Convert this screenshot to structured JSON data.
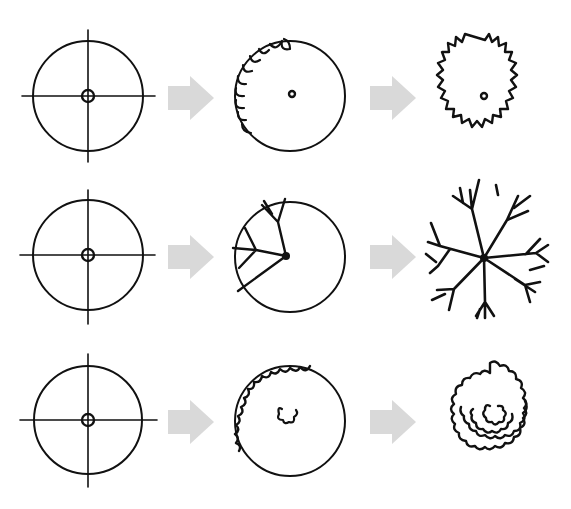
{
  "diagram": {
    "title": "",
    "colors": {
      "ink": "#111111",
      "arrow": "#d9d9d9",
      "background": "#ffffff"
    },
    "rows": [
      {
        "name": "scalloped-edge-tree",
        "steps": [
          "circle with crosshair guide",
          "scallops drawn along edge",
          "jagged outline with center dot"
        ]
      },
      {
        "name": "branching-tree",
        "steps": [
          "circle with crosshair guide",
          "branches drawn from center",
          "branch-only symbol"
        ]
      },
      {
        "name": "cloud-canopy-tree",
        "steps": [
          "circle with crosshair guide",
          "cloud edge and center squiggle",
          "layered cloud canopy"
        ]
      }
    ]
  }
}
